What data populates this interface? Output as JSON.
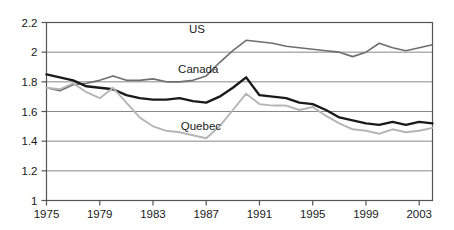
{
  "chart_data": {
    "type": "line",
    "title": "",
    "subtitle": "",
    "xlabel": "",
    "ylabel": "",
    "xlim": [
      1975,
      2004
    ],
    "ylim": [
      1,
      2.2
    ],
    "y_ticks": [
      "1",
      "1.2",
      "1.4",
      "1.6",
      "1.8",
      "2",
      "2.2"
    ],
    "y_tick_values": [
      1,
      1.2,
      1.4,
      1.6,
      1.8,
      2,
      2.2
    ],
    "x_ticks": [
      "1975",
      "1979",
      "1983",
      "1987",
      "1991",
      "1995",
      "1999",
      "2003"
    ],
    "x_tick_values": [
      1975,
      1979,
      1983,
      1987,
      1991,
      1995,
      1999,
      2003
    ],
    "grid": "horizontal",
    "legend_position": "inline-annotations",
    "x": [
      1975,
      1976,
      1977,
      1978,
      1979,
      1980,
      1981,
      1982,
      1983,
      1984,
      1985,
      1986,
      1987,
      1988,
      1989,
      1990,
      1991,
      1992,
      1993,
      1994,
      1995,
      1996,
      1997,
      1998,
      1999,
      2000,
      2001,
      2002,
      2003,
      2004
    ],
    "series": [
      {
        "name": "US",
        "color": "#6e6e6e",
        "width": 1.6,
        "values": [
          1.76,
          1.74,
          1.78,
          1.79,
          1.81,
          1.84,
          1.81,
          1.81,
          1.82,
          1.8,
          1.8,
          1.81,
          1.84,
          1.93,
          2.01,
          2.08,
          2.07,
          2.06,
          2.04,
          2.03,
          2.02,
          2.01,
          2.0,
          1.97,
          2.0,
          2.06,
          2.03,
          2.01,
          2.03,
          2.05
        ]
      },
      {
        "name": "Canada",
        "color": "#1a1a1a",
        "width": 2.4,
        "values": [
          1.85,
          1.83,
          1.81,
          1.77,
          1.76,
          1.75,
          1.71,
          1.69,
          1.68,
          1.68,
          1.69,
          1.67,
          1.66,
          1.7,
          1.76,
          1.83,
          1.71,
          1.7,
          1.69,
          1.66,
          1.65,
          1.61,
          1.56,
          1.54,
          1.52,
          1.51,
          1.53,
          1.51,
          1.53,
          1.52
        ]
      },
      {
        "name": "Quebec",
        "color": "#b5b5b5",
        "width": 1.9,
        "values": [
          1.76,
          1.75,
          1.79,
          1.73,
          1.69,
          1.76,
          1.66,
          1.56,
          1.5,
          1.47,
          1.46,
          1.44,
          1.42,
          1.5,
          1.61,
          1.72,
          1.65,
          1.64,
          1.64,
          1.61,
          1.63,
          1.57,
          1.52,
          1.48,
          1.47,
          1.45,
          1.48,
          1.46,
          1.47,
          1.49
        ]
      }
    ],
    "annotations": [
      {
        "name": "US",
        "text": "US",
        "x": 1986.3,
        "y": 2.155
      },
      {
        "name": "Canada",
        "text": "Canada",
        "x": 1986.4,
        "y": 1.885
      },
      {
        "name": "Quebec",
        "text": "Quebec",
        "x": 1986.6,
        "y": 1.505
      }
    ]
  },
  "style": {
    "axis_color": "#555555",
    "grid_color": "#888888",
    "background": "#ffffff",
    "text_color": "#1a1a1a"
  }
}
